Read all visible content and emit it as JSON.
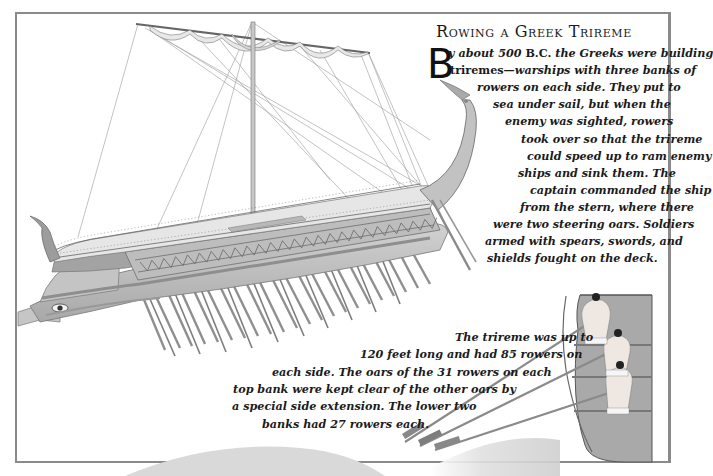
{
  "page": {
    "title": "Rowing a Greek Trireme",
    "intro": {
      "drop_cap": "B",
      "lines": [
        {
          "parts": [
            {
              "t": "y about 500 ",
              "s": "it"
            },
            {
              "t": "B.C.",
              "s": "sc"
            },
            {
              "t": " the Greeks were building",
              "s": "it"
            }
          ]
        },
        {
          "parts": [
            {
              "t": "triremes",
              "s": "bold"
            },
            {
              "t": "—warships with three banks of",
              "s": "it"
            }
          ]
        },
        {
          "parts": [
            {
              "t": "rowers on each side. They put to",
              "s": "it"
            }
          ]
        },
        {
          "parts": [
            {
              "t": "sea under sail, but when the",
              "s": "it"
            }
          ]
        },
        {
          "parts": [
            {
              "t": "enemy was sighted, rowers",
              "s": "it"
            }
          ]
        },
        {
          "parts": [
            {
              "t": "took over so that the trireme",
              "s": "it"
            }
          ]
        },
        {
          "parts": [
            {
              "t": "could speed up to ram enemy",
              "s": "it"
            }
          ]
        },
        {
          "parts": [
            {
              "t": "ships and sink them. The",
              "s": "it"
            }
          ]
        },
        {
          "parts": [
            {
              "t": "captain commanded the ship",
              "s": "it"
            }
          ]
        },
        {
          "parts": [
            {
              "t": "from the stern, where there",
              "s": "it"
            }
          ]
        },
        {
          "parts": [
            {
              "t": "were two steering oars. Soldiers",
              "s": "it"
            }
          ]
        },
        {
          "parts": [
            {
              "t": "armed with spears, swords, and",
              "s": "it"
            }
          ]
        },
        {
          "parts": [
            {
              "t": "shields fought on the deck.",
              "s": "it"
            }
          ]
        }
      ],
      "line_right_edges": [
        672,
        660,
        645,
        628,
        614,
        637,
        637,
        621,
        630,
        621,
        654,
        651,
        651
      ],
      "line_left_edges": [
        448,
        450,
        477,
        493,
        505,
        521,
        527,
        518,
        530,
        520,
        493,
        485,
        487
      ]
    },
    "caption": {
      "lines": [
        "The trireme was up to",
        "120 feet long and had 85 rowers on",
        "each side. The oars of the 31 rowers on each",
        "top bank were kept clear of the other oars by",
        "a special side extension. The lower two",
        "banks had 27 rowers each."
      ],
      "line_left_edges": [
        455,
        360,
        272,
        233,
        232,
        262
      ]
    }
  },
  "illustrations": {
    "trireme": "Greek trireme warship with mast, furled sail, three banks of oars, curved stern, eye on bow",
    "rowers_cutaway": "Cross-section of hull showing three rowers on tiered benches"
  },
  "colors": {
    "frame": "#8a8a8a",
    "text": "#1b1b1b",
    "hull": "#b9b9b9",
    "hull_dark": "#8e8e8e",
    "deck": "#e4e4e4",
    "oar": "#9a9a9a",
    "circle": "#d8d8d8",
    "section_bg": "#a9a9a9"
  }
}
